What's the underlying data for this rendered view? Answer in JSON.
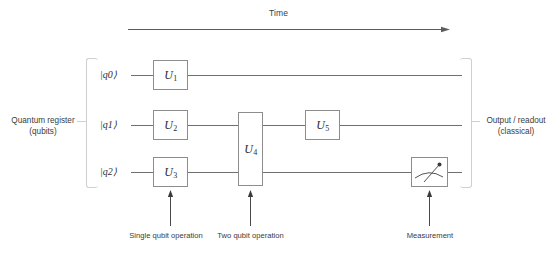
{
  "diagram": {
    "title_axis": "Time",
    "left_label_line1": "Quantum register",
    "left_label_line2": "(qubits)",
    "right_label_line1": "Output / readout",
    "right_label_line2": "(classical)",
    "colors": {
      "wire": "#6f6f6f",
      "gate_border": "#8d8d8d",
      "bracket": "#cfcfcf",
      "text": "#3b3b3b",
      "background": "#ffffff"
    }
  },
  "qubits": [
    {
      "label": "|q0⟩",
      "name": "q0"
    },
    {
      "label": "|q1⟩",
      "name": "q1"
    },
    {
      "label": "|q2⟩",
      "name": "q2"
    }
  ],
  "gates": [
    {
      "label": "U",
      "sub": "1",
      "qubits": [
        "q0"
      ],
      "kind": "single"
    },
    {
      "label": "U",
      "sub": "2",
      "qubits": [
        "q1"
      ],
      "kind": "single"
    },
    {
      "label": "U",
      "sub": "3",
      "qubits": [
        "q2"
      ],
      "kind": "single"
    },
    {
      "label": "U",
      "sub": "4",
      "qubits": [
        "q1",
        "q2"
      ],
      "kind": "two"
    },
    {
      "label": "U",
      "sub": "5",
      "qubits": [
        "q1"
      ],
      "kind": "single"
    }
  ],
  "measurement": {
    "qubit": "q2",
    "icon": "meter-gauge-icon"
  },
  "annotations": [
    {
      "text": "Single qubit operation",
      "target": "U3"
    },
    {
      "text": "Two qubit operation",
      "target": "U4"
    },
    {
      "text": "Measurement",
      "target": "measurement-box"
    }
  ]
}
